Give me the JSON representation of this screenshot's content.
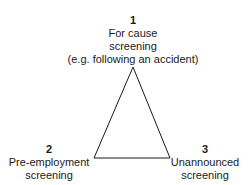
{
  "vertices": [
    {
      "number": "1",
      "line1": "For cause",
      "line2": "screening",
      "line3": "(e.g. following an accident)"
    },
    {
      "number": "2",
      "line1": "Pre-employment",
      "line2": "screening"
    },
    {
      "number": "3",
      "line1": "Unannounced",
      "line2": "screening"
    }
  ]
}
